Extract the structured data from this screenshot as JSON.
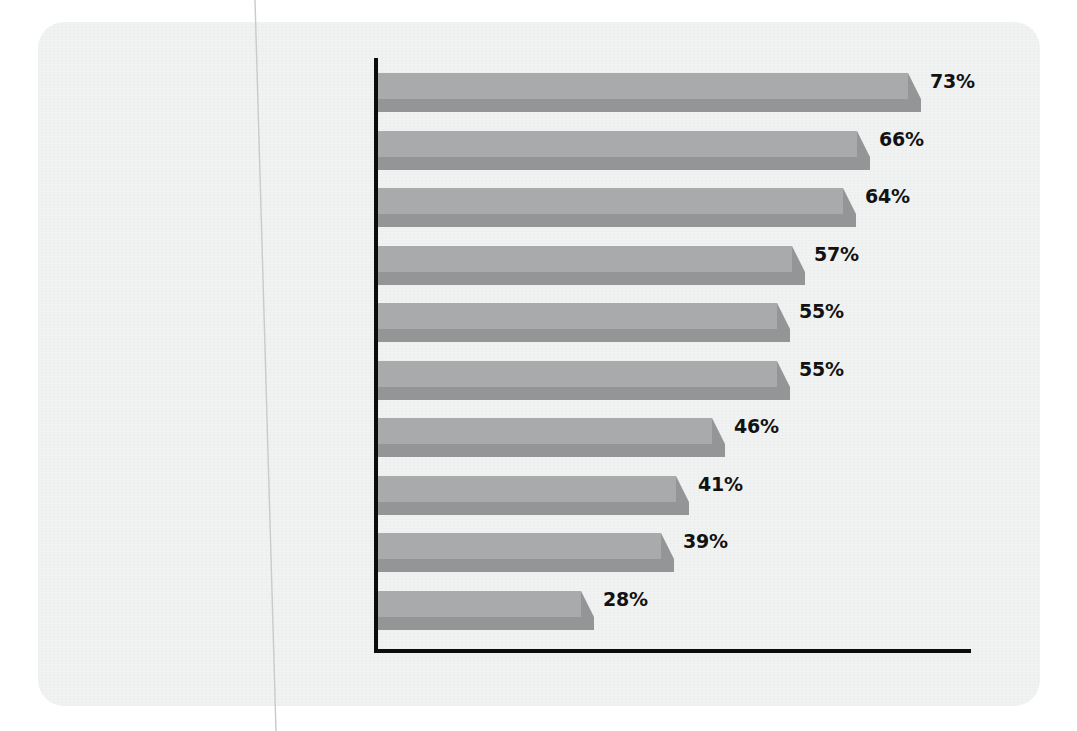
{
  "chart_data": {
    "type": "bar",
    "orientation": "horizontal",
    "title": "",
    "subtitle": "",
    "xlabel": "",
    "ylabel": "",
    "categories": [
      "Viruses and Worms",
      "Spyware",
      "Spam",
      "Outside Hackers",
      "Identity Theft",
      "Security Configuration Compliance",
      "Employees Violating Security",
      "Internal Hackers/Attacks",
      "Regulatory Compliance",
      "Don't Know"
    ],
    "values": [
      73,
      66,
      64,
      57,
      55,
      55,
      46,
      41,
      39,
      28
    ],
    "value_labels": [
      "73%",
      "66%",
      "64%",
      "57%",
      "55%",
      "55%",
      "46%",
      "41%",
      "39%",
      "28%"
    ],
    "unit": "%",
    "xlim": [
      0,
      82
    ],
    "grid": false,
    "legend": false,
    "axis_tick_labels": [],
    "colors": {
      "bar_top_face": "#a9aaab",
      "bar_front_face": "#949596",
      "axis": "#0d0d0d",
      "page_background": "#f1f2f2",
      "label_text": "#141414",
      "value_text": "#121212"
    }
  },
  "page": {
    "background": "#ffffff"
  }
}
